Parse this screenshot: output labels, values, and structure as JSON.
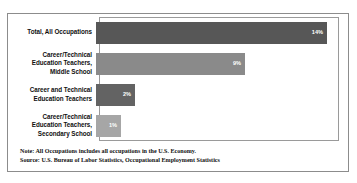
{
  "title": "",
  "chart_data": {
    "type": "bar",
    "orientation": "horizontal",
    "title": "",
    "xlabel": "",
    "ylabel": "",
    "grid": false,
    "legend": null,
    "xlim": [
      0,
      15
    ],
    "categories": [
      "Total, All Occupations",
      "Career/Technical\nEducation Teachers,\nMiddle School",
      "Career and Technical\nEducation Teachers",
      "Career/Technical\nEducation Teachers,\nSecondary School"
    ],
    "values": [
      14,
      9,
      2,
      1
    ],
    "value_labels": [
      "14%",
      "9%",
      "2%",
      "1%"
    ],
    "bar_colors": [
      "#575757",
      "#8a8a8a",
      "#636363",
      "#a6a6a6"
    ],
    "bar_widths_px": [
      231,
      149,
      39,
      25
    ]
  },
  "bars": [
    {
      "label_lines": [
        "Total, All Occupations"
      ],
      "value_label": "14%",
      "color": "#575757",
      "width_px": 231
    },
    {
      "label_lines": [
        "Career/Technical",
        "Education Teachers,",
        "Middle School"
      ],
      "value_label": "9%",
      "color": "#8a8a8a",
      "width_px": 149
    },
    {
      "label_lines": [
        "Career and Technical",
        "Education Teachers"
      ],
      "value_label": "2%",
      "color": "#636363",
      "width_px": 39
    },
    {
      "label_lines": [
        "Career/Technical",
        "Education Teachers,",
        "Secondary School"
      ],
      "value_label": "1%",
      "color": "#a6a6a6",
      "width_px": 25
    }
  ],
  "footnote": {
    "note": "Note: All Occupations includes all occupations in the U.S. Economy.",
    "source": "Source: U.S. Bureau of Labor Statistics, Occupational Employment Statistics"
  },
  "colors": {
    "frame": "#8c8c8c",
    "plot_border": "#9a9a9a",
    "text": "#101010",
    "value_text": "#ffffff",
    "background": "#ffffff"
  }
}
